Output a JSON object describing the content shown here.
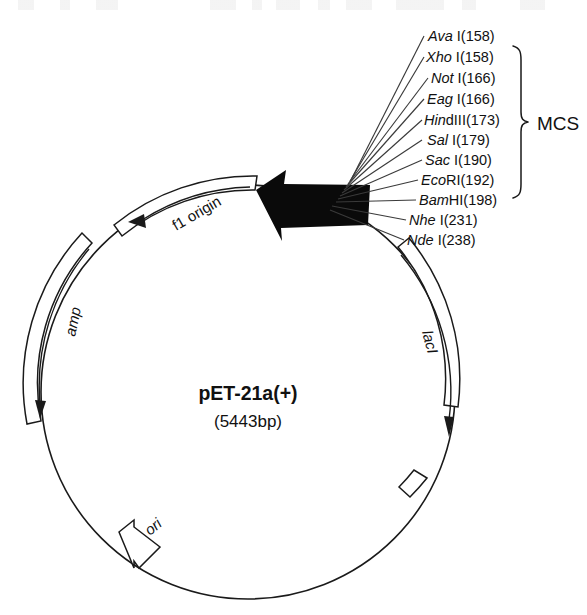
{
  "figure": {
    "type": "plasmid-map",
    "plasmid_name": "pET-21a(+)",
    "plasmid_size": "(5443bp)"
  },
  "restriction_sites": [
    {
      "enzyme_italic": "Ava",
      "enzyme_rest": " I",
      "position": "(158)"
    },
    {
      "enzyme_italic": "Xho",
      "enzyme_rest": " I",
      "position": "(158)"
    },
    {
      "enzyme_italic": "Not",
      "enzyme_rest": " I",
      "position": "(166)"
    },
    {
      "enzyme_italic": "Eag",
      "enzyme_rest": " I",
      "position": "(166)"
    },
    {
      "enzyme_italic": "Hin",
      "enzyme_rest": "dIII",
      "position": "(173)"
    },
    {
      "enzyme_italic": "Sal",
      "enzyme_rest": " I",
      "position": "(179)"
    },
    {
      "enzyme_italic": "Sac",
      "enzyme_rest": " I",
      "position": "(190)"
    },
    {
      "enzyme_italic": "Eco",
      "enzyme_rest": "RI",
      "position": "(192)"
    },
    {
      "enzyme_italic": "Bam",
      "enzyme_rest": "HI",
      "position": "(198)"
    },
    {
      "enzyme_italic": "Nhe",
      "enzyme_rest": " I",
      "position": "(231)"
    },
    {
      "enzyme_italic": "Nde",
      "enzyme_rest": " I",
      "position": "(238)"
    }
  ],
  "annotations": {
    "mcs_label": "MCS",
    "mcs_bracket_first_site": "Xho I(158)",
    "mcs_bracket_last_site": "Bam HI(198)"
  },
  "features": [
    {
      "id": "f1-origin",
      "label": "f1 origin",
      "style": "upright"
    },
    {
      "id": "amp",
      "label": "amp",
      "style": "italic"
    },
    {
      "id": "lacI",
      "label": "lacI",
      "style": "italic"
    },
    {
      "id": "ori",
      "label": "ori",
      "style": "italic"
    }
  ],
  "colors": {
    "ink": "#111111",
    "line": "#1a1a1a",
    "leader": "#3a3a3a",
    "mcs_block": "#0a0a0a",
    "background": "#ffffff"
  }
}
